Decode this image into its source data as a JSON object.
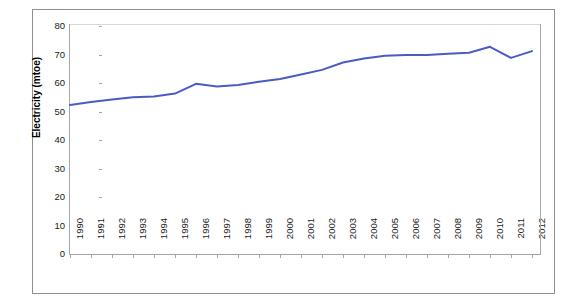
{
  "chart_data": {
    "type": "line",
    "title": "",
    "xlabel": "",
    "ylabel": "Electricity (mtoe)",
    "xlim": [
      1990,
      2012
    ],
    "ylim": [
      0,
      80
    ],
    "ytick_step": 10,
    "grid": false,
    "legend": false,
    "line_color": "#4A5BC4",
    "categories": [
      "1990",
      "1991",
      "1992",
      "1993",
      "1994",
      "1995",
      "1996",
      "1997",
      "1998",
      "1999",
      "2000",
      "2001",
      "2002",
      "2003",
      "2004",
      "2005",
      "2006",
      "2007",
      "2008",
      "2009",
      "2010",
      "2011",
      "2012"
    ],
    "x": [
      1990,
      1991,
      1992,
      1993,
      1994,
      1995,
      1996,
      1997,
      1998,
      1999,
      2000,
      2001,
      2002,
      2003,
      2004,
      2005,
      2006,
      2007,
      2008,
      2009,
      2010,
      2011,
      2012
    ],
    "values": [
      52.3,
      53.3,
      54.2,
      55.0,
      55.3,
      56.3,
      59.7,
      58.8,
      59.3,
      60.4,
      61.4,
      63.0,
      64.6,
      67.2,
      68.6,
      69.6,
      69.8,
      69.8,
      70.3,
      70.6,
      72.7,
      68.8,
      71.2
    ],
    "ytick_labels": [
      "0",
      "10",
      "20",
      "30",
      "40",
      "50",
      "60",
      "70",
      "80"
    ],
    "series": [
      {
        "name": "Electricity",
        "values": [
          52.3,
          53.3,
          54.2,
          55.0,
          55.3,
          56.3,
          59.7,
          58.8,
          59.3,
          60.4,
          61.4,
          63.0,
          64.6,
          67.2,
          68.6,
          69.6,
          69.8,
          69.8,
          70.3,
          70.6,
          72.7,
          68.8,
          71.2
        ]
      }
    ]
  },
  "axes": {
    "y_title": "Electricity (mtoe)"
  }
}
